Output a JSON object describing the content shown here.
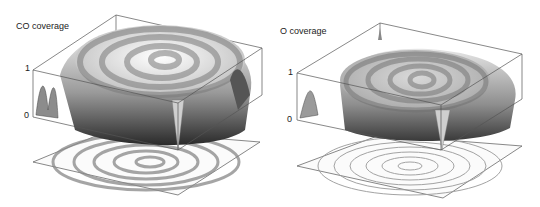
{
  "figure": {
    "panels": [
      {
        "id": "co",
        "title": "CO coverage",
        "z_ticks": [
          "1",
          "0"
        ],
        "plot": "3D surface with spiral wave and projected contour map"
      },
      {
        "id": "o",
        "title": "O coverage",
        "z_ticks": [
          "1",
          "0"
        ],
        "plot": "3D surface with spiral wave and projected contour map"
      }
    ]
  }
}
